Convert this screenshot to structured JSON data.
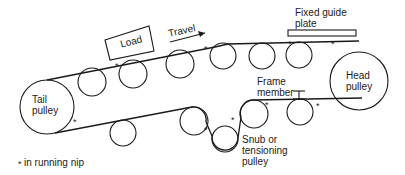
{
  "diagram": {
    "labels": {
      "load": "Load",
      "travel": "Travel",
      "fixed_guide_plate": "Fixed guide\nplate",
      "head_pulley": "Head\npulley",
      "tail_pulley": "Tail\npulley",
      "frame_member": "Frame\nmember",
      "snub_pulley": "Snub or\ntensioning\npulley",
      "legend": "in running nip"
    },
    "nip_symbol": "*",
    "colors": {
      "line": "#1a1a1a",
      "background": "#ffffff"
    }
  }
}
